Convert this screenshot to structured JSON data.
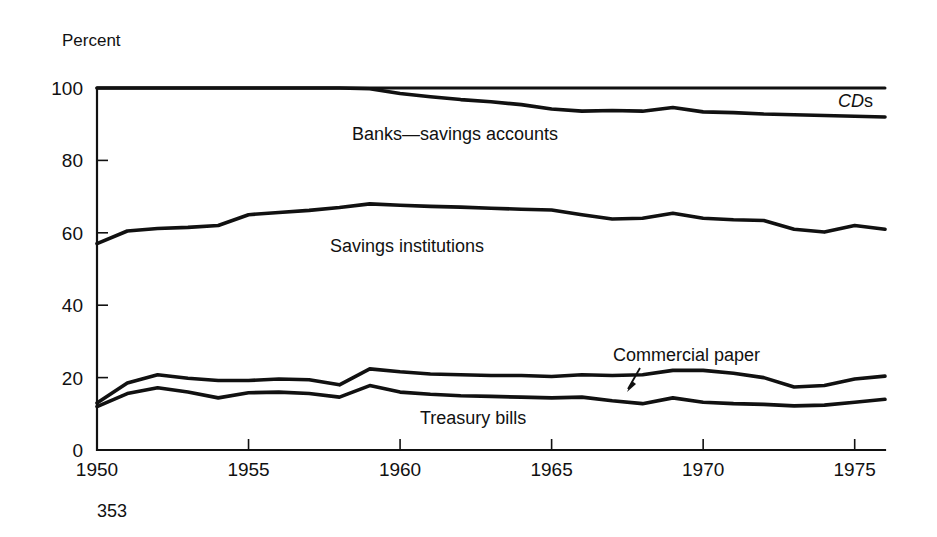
{
  "figure": {
    "page_number": "353",
    "y_axis_title": "Percent"
  },
  "chart_data": {
    "type": "line",
    "title": "",
    "subtitle": "",
    "xlabel": "",
    "ylabel": "Percent",
    "xlim": [
      1950,
      1976
    ],
    "ylim": [
      0,
      100
    ],
    "grid": false,
    "legend_position": "inline-annotations",
    "x_tick_labels": [
      "1950",
      "1955",
      "1960",
      "1965",
      "1970",
      "1975"
    ],
    "x_ticks": [
      1950,
      1955,
      1960,
      1965,
      1970,
      1975
    ],
    "y_tick_labels": [
      "0",
      "20",
      "40",
      "60",
      "80",
      "100"
    ],
    "y_ticks": [
      0,
      20,
      40,
      60,
      80,
      100
    ],
    "x": [
      1950,
      1951,
      1952,
      1953,
      1954,
      1955,
      1956,
      1957,
      1958,
      1959,
      1960,
      1961,
      1962,
      1963,
      1964,
      1965,
      1966,
      1967,
      1968,
      1969,
      1970,
      1971,
      1972,
      1973,
      1974,
      1975,
      1976
    ],
    "series": [
      {
        "name": "CDs",
        "label": "CDs",
        "label_style": "italic-CD-roman-s",
        "values": [
          100,
          100,
          100,
          100,
          100,
          100,
          100,
          100,
          100,
          100,
          100,
          100,
          100,
          100,
          100,
          100,
          100,
          100,
          100,
          100,
          100,
          100,
          100,
          100,
          100,
          100,
          100
        ]
      },
      {
        "name": "Banks-savings accounts",
        "label": "Banks—savings accounts",
        "values": [
          100,
          100,
          100,
          100,
          100,
          100,
          100,
          100,
          100,
          99.8,
          98.5,
          97.6,
          96.8,
          96.2,
          95.4,
          94.2,
          93.6,
          93.8,
          93.6,
          94.6,
          93.4,
          93.2,
          92.8,
          92.6,
          92.4,
          92.2,
          92.0
        ]
      },
      {
        "name": "Savings institutions",
        "label": "Savings institutions",
        "values": [
          57,
          60.5,
          61.2,
          61.5,
          62.0,
          65.0,
          65.6,
          66.2,
          67.0,
          68.0,
          67.6,
          67.3,
          67.1,
          66.8,
          66.5,
          66.3,
          65.0,
          63.8,
          64.0,
          65.4,
          64.0,
          63.6,
          63.4,
          61.0,
          60.2,
          62.0,
          61.0
        ]
      },
      {
        "name": "Commercial paper",
        "label": "Commercial paper",
        "annotation": "arrow",
        "values": [
          13.0,
          18.5,
          20.8,
          19.8,
          19.2,
          19.2,
          19.6,
          19.4,
          18.0,
          22.4,
          21.6,
          21.0,
          20.8,
          20.6,
          20.6,
          20.3,
          20.8,
          20.6,
          20.8,
          22.0,
          22.0,
          21.2,
          20.0,
          17.4,
          17.8,
          19.6,
          20.4
        ]
      },
      {
        "name": "Treasury bills",
        "label": "Treasury bills",
        "values": [
          12.0,
          15.6,
          17.2,
          16.0,
          14.4,
          15.8,
          16.0,
          15.6,
          14.6,
          17.8,
          16.0,
          15.4,
          15.0,
          14.8,
          14.6,
          14.4,
          14.6,
          13.6,
          12.8,
          14.4,
          13.2,
          12.8,
          12.6,
          12.2,
          12.4,
          13.2,
          14.0
        ]
      }
    ],
    "colors": {
      "line": "#111111",
      "axis": "#111111",
      "background": "#ffffff"
    }
  }
}
